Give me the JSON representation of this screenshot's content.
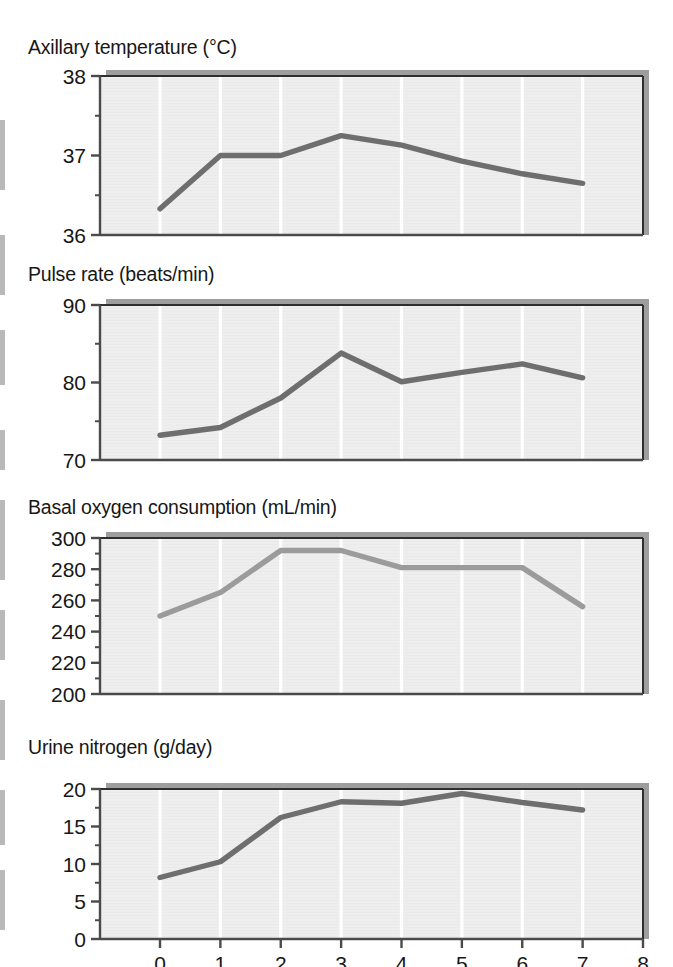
{
  "figure": {
    "x_axis_title": "Days after injury",
    "x_ticks": [
      "0",
      "1",
      "2",
      "3",
      "4",
      "5",
      "6",
      "7",
      "8"
    ],
    "injury_marker": "up-arrow-at-day-0",
    "colors": {
      "plot_background": "#eaeaea",
      "gridline": "#ffffff",
      "frame": "#4a4a4a",
      "shadow": "#9e9e9e",
      "line_dark": "#6e6e6e",
      "line_light": "#9b9b9b",
      "text": "#171717"
    }
  },
  "chart_data": [
    {
      "type": "line",
      "title": "Axillary temperature (°C)",
      "xlabel": "Days after injury",
      "ylabel": "Axillary temperature (°C)",
      "xlim": [
        -0.95,
        8
      ],
      "ylim": [
        36,
        38
      ],
      "yticks": [
        36,
        37,
        38
      ],
      "yticklabels": [
        "36",
        "37",
        "38"
      ],
      "yminor_step": 0.5,
      "grid": "vertical",
      "line_color": "#6e6e6e",
      "x": [
        0,
        1,
        2,
        3,
        4,
        5,
        6,
        7
      ],
      "values": [
        36.33,
        37.0,
        37.0,
        37.25,
        37.13,
        36.93,
        36.77,
        36.65
      ]
    },
    {
      "type": "line",
      "title": "Pulse rate (beats/min)",
      "xlabel": "Days after injury",
      "ylabel": "Pulse rate (beats/min)",
      "xlim": [
        -0.95,
        8
      ],
      "ylim": [
        70,
        90
      ],
      "yticks": [
        70,
        80,
        90
      ],
      "yticklabels": [
        "70",
        "80",
        "90"
      ],
      "yminor_step": 5,
      "grid": "vertical",
      "line_color": "#6e6e6e",
      "x": [
        0,
        1,
        2,
        3,
        4,
        5,
        6,
        7
      ],
      "values": [
        73.2,
        74.2,
        78.0,
        83.8,
        80.1,
        81.3,
        82.4,
        80.6
      ]
    },
    {
      "type": "line",
      "title": "Basal oxygen consumption (mL/min)",
      "xlabel": "Days after injury",
      "ylabel": "Basal oxygen consumption (mL/min)",
      "xlim": [
        -0.95,
        8
      ],
      "ylim": [
        200,
        300
      ],
      "yticks": [
        200,
        220,
        240,
        260,
        280,
        300
      ],
      "yticklabels": [
        "200",
        "220",
        "240",
        "260",
        "280",
        "300"
      ],
      "yminor_step": 10,
      "grid": "vertical",
      "line_color": "#9b9b9b",
      "x": [
        0,
        1,
        2,
        3,
        4,
        5,
        6,
        7
      ],
      "values": [
        250,
        265,
        292,
        292,
        281,
        281,
        281,
        256
      ]
    },
    {
      "type": "line",
      "title": "Urine nitrogen (g/day)",
      "xlabel": "Days after injury",
      "ylabel": "Urine nitrogen (g/day)",
      "xlim": [
        -0.95,
        8
      ],
      "ylim": [
        0,
        20
      ],
      "yticks": [
        0,
        5,
        10,
        15,
        20
      ],
      "yticklabels": [
        "0",
        "5",
        "10",
        "15",
        "20"
      ],
      "yminor_step": 2.5,
      "grid": "vertical",
      "line_color": "#6e6e6e",
      "x": [
        0,
        1,
        2,
        3,
        4,
        5,
        6,
        7
      ],
      "values": [
        8.2,
        10.3,
        16.2,
        18.3,
        18.1,
        19.4,
        18.2,
        17.2
      ]
    }
  ]
}
